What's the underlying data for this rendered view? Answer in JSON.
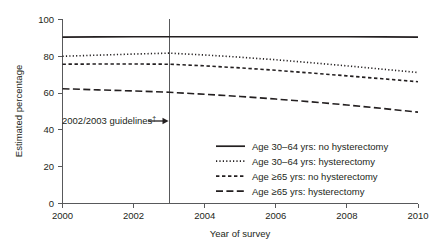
{
  "chart_data": {
    "type": "line",
    "title": "",
    "subtitle": "",
    "xlabel": "Year of survey",
    "ylabel": "Estimated percentage",
    "xlim": [
      2000,
      2010
    ],
    "ylim": [
      0,
      100
    ],
    "grid": false,
    "legend_position": "inside lower right",
    "x_ticks": [
      2000,
      2002,
      2004,
      2006,
      2008,
      2010
    ],
    "x_tick_labels": [
      "2000",
      "2002",
      "2004",
      "2006",
      "2008",
      "2010"
    ],
    "y_ticks": [
      0,
      20,
      40,
      60,
      80,
      100
    ],
    "y_tick_labels": [
      "0",
      "20",
      "40",
      "60",
      "80",
      "100"
    ],
    "x": [
      2000,
      2001,
      2002,
      2003,
      2004,
      2005,
      2006,
      2007,
      2008,
      2009,
      2010
    ],
    "series": [
      {
        "name": "Age 30–64 yrs: no hysterectomy",
        "style": "solid",
        "values": [
          90.2,
          90.3,
          90.4,
          90.4,
          90.4,
          90.4,
          90.4,
          90.4,
          90.4,
          90.3,
          90.2
        ]
      },
      {
        "name": "Age 30–64 yrs: hysterectomy",
        "style": "dotted",
        "values": [
          79.8,
          80.4,
          81.0,
          81.5,
          80.5,
          79.3,
          77.9,
          76.3,
          74.6,
          72.8,
          71.0
        ]
      },
      {
        "name": "Age ≥65 yrs: no hysterectomy",
        "style": "dashed",
        "values": [
          75.5,
          75.6,
          75.6,
          75.5,
          74.6,
          73.5,
          72.2,
          70.7,
          69.2,
          67.6,
          66.0
        ]
      },
      {
        "name": "Age ≥65 yrs: hysterectomy",
        "style": "long-dash",
        "values": [
          62.2,
          61.6,
          61.0,
          60.3,
          59.2,
          58.0,
          56.6,
          55.1,
          53.4,
          51.5,
          49.5
        ]
      }
    ],
    "annotations": [
      {
        "text": "2002/2003 guidelines",
        "marker": "†",
        "arrow": "right",
        "at_x": 2003,
        "label_y": 34
      }
    ],
    "vertical_reference_line": {
      "x": 2003,
      "label": "2002/2003 guidelines"
    }
  },
  "legend": {
    "entries": [
      {
        "label": "Age 30–64 yrs: no hysterectomy",
        "style": "solid"
      },
      {
        "label": "Age 30–64 yrs: hysterectomy",
        "style": "dotted"
      },
      {
        "label": "Age ≥65 yrs: no hysterectomy",
        "style": "dashed"
      },
      {
        "label": "Age ≥65 yrs: hysterectomy",
        "style": "long-dash"
      }
    ]
  },
  "axes": {
    "y_title": "Estimated percentage",
    "x_title": "Year of survey",
    "y_labels": [
      "100",
      "80",
      "60",
      "40",
      "20",
      "0"
    ],
    "x_labels": [
      "2000",
      "2002",
      "2004",
      "2006",
      "2008",
      "2010"
    ]
  },
  "annotation": {
    "text": "2002/2003 guidelines",
    "dagger": "†"
  },
  "colors": {
    "ink": "#231f20",
    "axis": "#58595b",
    "background": "#ffffff"
  }
}
